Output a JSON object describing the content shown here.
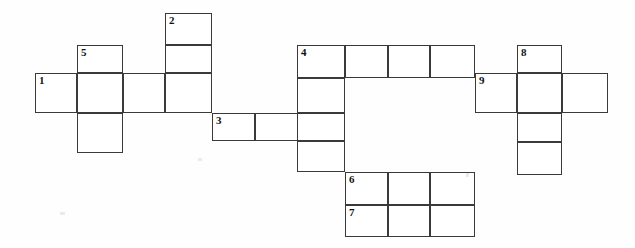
{
  "puzzle": {
    "title": "Crossword Grid",
    "type": "blank-crossword",
    "cell_fill_color": "#ffffff",
    "line_color": "#3a3a3a",
    "background_color": "#fefefe",
    "numbers": [
      "1",
      "2",
      "3",
      "4",
      "5",
      "6",
      "7",
      "8",
      "9"
    ],
    "clue_numbers": {
      "n1": "1",
      "n2": "2",
      "n3": "3",
      "n4": "4",
      "n5": "5",
      "n6": "6",
      "n7": "7",
      "n8": "8",
      "n9": "9"
    },
    "entries": [
      {
        "number": "1",
        "direction": "across",
        "length": 4,
        "cells": [
          {
            "x": 35,
            "y": 73,
            "w": 42,
            "h": 40
          },
          {
            "x": 77,
            "y": 73,
            "w": 46,
            "h": 40
          },
          {
            "x": 123,
            "y": 73,
            "w": 42,
            "h": 40
          },
          {
            "x": 165,
            "y": 73,
            "w": 47,
            "h": 40
          }
        ]
      },
      {
        "number": "2",
        "direction": "down",
        "length": 3,
        "cells": [
          {
            "x": 165,
            "y": 13,
            "w": 47,
            "h": 32
          },
          {
            "x": 165,
            "y": 45,
            "w": 47,
            "h": 28
          },
          {
            "x": 165,
            "y": 73,
            "w": 47,
            "h": 40
          }
        ]
      },
      {
        "number": "3",
        "direction": "across",
        "length": 3,
        "cells": [
          {
            "x": 212,
            "y": 113,
            "w": 43,
            "h": 28
          },
          {
            "x": 255,
            "y": 113,
            "w": 45,
            "h": 28
          },
          {
            "x": 300,
            "y": 113,
            "w": 45,
            "h": 28
          }
        ]
      },
      {
        "number": "4",
        "direction": "across",
        "length": 4,
        "cells": [
          {
            "x": 297,
            "y": 45,
            "w": 48,
            "h": 33
          },
          {
            "x": 345,
            "y": 45,
            "w": 43,
            "h": 33
          },
          {
            "x": 388,
            "y": 45,
            "w": 42,
            "h": 33
          },
          {
            "x": 430,
            "y": 45,
            "w": 45,
            "h": 33
          }
        ]
      },
      {
        "number": "4",
        "direction": "down",
        "length": 4,
        "cells": [
          {
            "x": 297,
            "y": 45,
            "w": 48,
            "h": 33
          },
          {
            "x": 297,
            "y": 78,
            "w": 48,
            "h": 35
          },
          {
            "x": 297,
            "y": 113,
            "w": 48,
            "h": 28
          },
          {
            "x": 297,
            "y": 141,
            "w": 48,
            "h": 31
          }
        ]
      },
      {
        "number": "5",
        "direction": "down",
        "length": 3,
        "cells": [
          {
            "x": 77,
            "y": 45,
            "w": 46,
            "h": 28
          },
          {
            "x": 77,
            "y": 73,
            "w": 46,
            "h": 40
          },
          {
            "x": 77,
            "y": 113,
            "w": 46,
            "h": 40
          }
        ]
      },
      {
        "number": "6",
        "direction": "across",
        "length": 3,
        "cells": [
          {
            "x": 345,
            "y": 172,
            "w": 43,
            "h": 33
          },
          {
            "x": 388,
            "y": 172,
            "w": 42,
            "h": 33
          },
          {
            "x": 430,
            "y": 172,
            "w": 45,
            "h": 33
          }
        ]
      },
      {
        "number": "7",
        "direction": "across",
        "length": 3,
        "cells": [
          {
            "x": 345,
            "y": 205,
            "w": 43,
            "h": 32
          },
          {
            "x": 388,
            "y": 205,
            "w": 42,
            "h": 32
          },
          {
            "x": 430,
            "y": 205,
            "w": 45,
            "h": 32
          }
        ]
      },
      {
        "number": "8",
        "direction": "down",
        "length": 4,
        "cells": [
          {
            "x": 517,
            "y": 45,
            "w": 45,
            "h": 28
          },
          {
            "x": 517,
            "y": 73,
            "w": 45,
            "h": 40
          },
          {
            "x": 517,
            "y": 113,
            "w": 45,
            "h": 29
          },
          {
            "x": 517,
            "y": 142,
            "w": 45,
            "h": 33
          }
        ]
      },
      {
        "number": "9",
        "direction": "across",
        "length": 3,
        "cells": [
          {
            "x": 475,
            "y": 73,
            "w": 42,
            "h": 40
          },
          {
            "x": 517,
            "y": 73,
            "w": 45,
            "h": 40
          },
          {
            "x": 562,
            "y": 73,
            "w": 46,
            "h": 40
          }
        ]
      }
    ],
    "number_positions": [
      {
        "label": "1",
        "x": 35,
        "y": 73
      },
      {
        "label": "2",
        "x": 165,
        "y": 13
      },
      {
        "label": "3",
        "x": 212,
        "y": 113
      },
      {
        "label": "4",
        "x": 297,
        "y": 45
      },
      {
        "label": "5",
        "x": 77,
        "y": 45
      },
      {
        "label": "6",
        "x": 345,
        "y": 172
      },
      {
        "label": "7",
        "x": 345,
        "y": 205
      },
      {
        "label": "8",
        "x": 517,
        "y": 45
      },
      {
        "label": "9",
        "x": 475,
        "y": 73
      }
    ],
    "all_cells": [
      {
        "x": 35,
        "y": 73,
        "w": 42,
        "h": 40
      },
      {
        "x": 77,
        "y": 45,
        "w": 46,
        "h": 28
      },
      {
        "x": 77,
        "y": 73,
        "w": 46,
        "h": 40
      },
      {
        "x": 77,
        "y": 113,
        "w": 46,
        "h": 40
      },
      {
        "x": 123,
        "y": 73,
        "w": 42,
        "h": 40
      },
      {
        "x": 165,
        "y": 13,
        "w": 47,
        "h": 32
      },
      {
        "x": 165,
        "y": 45,
        "w": 47,
        "h": 28
      },
      {
        "x": 165,
        "y": 73,
        "w": 47,
        "h": 40
      },
      {
        "x": 212,
        "y": 113,
        "w": 43,
        "h": 28
      },
      {
        "x": 255,
        "y": 113,
        "w": 45,
        "h": 28
      },
      {
        "x": 297,
        "y": 45,
        "w": 48,
        "h": 33
      },
      {
        "x": 345,
        "y": 45,
        "w": 43,
        "h": 33
      },
      {
        "x": 388,
        "y": 45,
        "w": 42,
        "h": 33
      },
      {
        "x": 430,
        "y": 45,
        "w": 45,
        "h": 33
      },
      {
        "x": 297,
        "y": 78,
        "w": 48,
        "h": 35
      },
      {
        "x": 297,
        "y": 113,
        "w": 48,
        "h": 28
      },
      {
        "x": 297,
        "y": 141,
        "w": 48,
        "h": 31
      },
      {
        "x": 345,
        "y": 172,
        "w": 43,
        "h": 33
      },
      {
        "x": 388,
        "y": 172,
        "w": 42,
        "h": 33
      },
      {
        "x": 430,
        "y": 172,
        "w": 45,
        "h": 33
      },
      {
        "x": 345,
        "y": 205,
        "w": 43,
        "h": 32
      },
      {
        "x": 388,
        "y": 205,
        "w": 42,
        "h": 32
      },
      {
        "x": 430,
        "y": 205,
        "w": 45,
        "h": 32
      },
      {
        "x": 475,
        "y": 73,
        "w": 42,
        "h": 40
      },
      {
        "x": 517,
        "y": 45,
        "w": 45,
        "h": 28
      },
      {
        "x": 517,
        "y": 73,
        "w": 45,
        "h": 40
      },
      {
        "x": 517,
        "y": 113,
        "w": 45,
        "h": 29
      },
      {
        "x": 517,
        "y": 142,
        "w": 45,
        "h": 33
      },
      {
        "x": 562,
        "y": 73,
        "w": 46,
        "h": 40
      }
    ],
    "specks": [
      {
        "x": 198,
        "y": 158,
        "w": 4,
        "h": 3
      },
      {
        "x": 466,
        "y": 173,
        "w": 3,
        "h": 4
      },
      {
        "x": 60,
        "y": 212,
        "w": 5,
        "h": 3
      }
    ]
  }
}
